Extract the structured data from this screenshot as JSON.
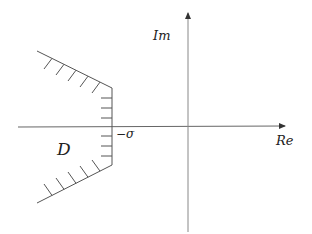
{
  "diagram": {
    "type": "complex-plane-region",
    "axes": {
      "x_label": "Re",
      "y_label": "Im",
      "origin": [
        188,
        127
      ],
      "x_axis": {
        "from": [
          18,
          127
        ],
        "to": [
          286,
          126
        ]
      },
      "y_axis": {
        "from": [
          188,
          232
        ],
        "to": [
          188,
          12
        ]
      }
    },
    "region": {
      "label": "𝒟",
      "label_text": "D",
      "boundary_marker_label": "−σ",
      "upper_edge": {
        "from": [
          37,
          51
        ],
        "to": [
          112,
          88
        ]
      },
      "vertical_edge": {
        "from": [
          112,
          88
        ],
        "to": [
          112,
          165
        ]
      },
      "lower_edge": {
        "from": [
          112,
          165
        ],
        "to": [
          37,
          203
        ]
      },
      "hatch_count_upper": 5,
      "hatch_count_vertical": 6,
      "hatch_count_lower": 5
    },
    "colors": {
      "line": "#555555",
      "axis": "#666666",
      "text": "#222222"
    }
  }
}
